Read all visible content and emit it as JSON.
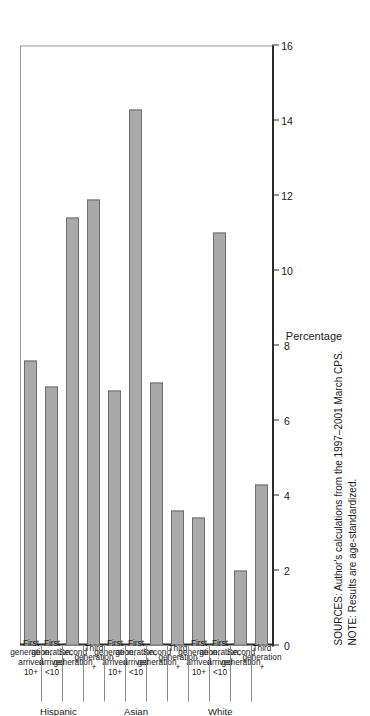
{
  "chart_data": {
    "type": "bar",
    "orientation": "horizontal",
    "title": "",
    "xlabel": "",
    "ylabel": "Percentage",
    "ylim": [
      0,
      16
    ],
    "yticks": [
      0,
      2,
      4,
      6,
      8,
      10,
      12,
      14,
      16
    ],
    "ytick_labels": [
      "0",
      "2",
      "4",
      "6",
      "8",
      "10",
      "12",
      "14",
      "16"
    ],
    "grid": false,
    "legend": false,
    "bar_color": "#a9a9a9",
    "bar_edge_color": "#6d6d6d",
    "categories": [
      "First generation, arrived 10+",
      "First generation, arrived <10",
      "Second generation",
      "Third generation +",
      "First generation, arrived 10+",
      "First generation, arrived <10",
      "Second generation",
      "Third generation +",
      "First generation, arrived 10+",
      "First generation, arrived <10",
      "Second generation",
      "Third generation +"
    ],
    "values": [
      7.6,
      6.9,
      11.4,
      11.9,
      6.8,
      14.3,
      7.0,
      3.6,
      3.4,
      11.0,
      2.0,
      4.3
    ],
    "groups": [
      {
        "name": "Hispanic",
        "start": 0,
        "end": 3
      },
      {
        "name": "Asian",
        "start": 4,
        "end": 7
      },
      {
        "name": "White",
        "start": 8,
        "end": 11
      }
    ]
  },
  "axis": {
    "value_title": "Percentage",
    "tick_labels": [
      "16",
      "14",
      "12",
      "10",
      "8",
      "6",
      "4",
      "2",
      "0"
    ]
  },
  "bars": [
    {
      "line1": "First",
      "line2": "generation,\narrived\n10+",
      "value": 7.6
    },
    {
      "line1": "First",
      "line2": "generation,\narrived\n<10",
      "value": 6.9
    },
    {
      "line1": "Second",
      "line2": "generation",
      "value": 11.4
    },
    {
      "line1": "Third",
      "line2": "generation\n+",
      "value": 11.9
    },
    {
      "line1": "First",
      "line2": "generation,\narrived\n10+",
      "value": 6.8
    },
    {
      "line1": "First",
      "line2": "generation,\narrived\n<10",
      "value": 14.3
    },
    {
      "line1": "Second",
      "line2": "generation",
      "value": 7.0
    },
    {
      "line1": "Third",
      "line2": "generation\n+",
      "value": 3.6
    },
    {
      "line1": "First",
      "line2": "generation,\narrived\n10+",
      "value": 3.4
    },
    {
      "line1": "First",
      "line2": "generation,\narrived\n<10",
      "value": 11.0
    },
    {
      "line1": "Second",
      "line2": "generation",
      "value": 2.0
    },
    {
      "line1": "Third",
      "line2": "generation\n+",
      "value": 4.3
    }
  ],
  "group_labels": [
    {
      "name": "Hispanic"
    },
    {
      "name": "Asian"
    },
    {
      "name": "White"
    }
  ],
  "footnotes": {
    "sources": "SOURCES: Author's calculations from the 1997–2001 March CPS.",
    "note": "NOTE: Results are age-standardized."
  }
}
